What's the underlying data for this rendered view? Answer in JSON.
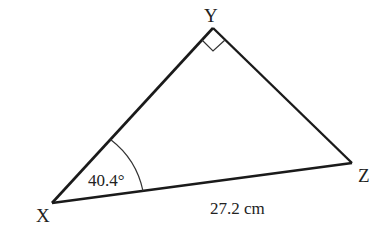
{
  "diagram": {
    "type": "right-triangle",
    "vertices": {
      "X": {
        "label": "X",
        "x": 52,
        "y": 203
      },
      "Y": {
        "label": "Y",
        "x": 213,
        "y": 28
      },
      "Z": {
        "label": "Z",
        "x": 352,
        "y": 163
      }
    },
    "angle_X": {
      "label": "40.4°"
    },
    "right_angle_at": "Y",
    "side_XZ": {
      "label": "27.2 cm"
    },
    "stroke_color": "#1a1a1a"
  }
}
